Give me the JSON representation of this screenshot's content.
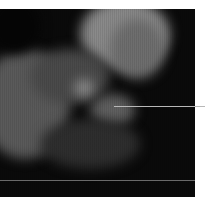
{
  "image": {
    "kind": "grayscale endoscopic-style photograph",
    "annotations": {
      "pointer_line": {
        "color": "#b8b8b8"
      },
      "horizontal_rule": {
        "color": "#6a6a6a"
      }
    }
  }
}
